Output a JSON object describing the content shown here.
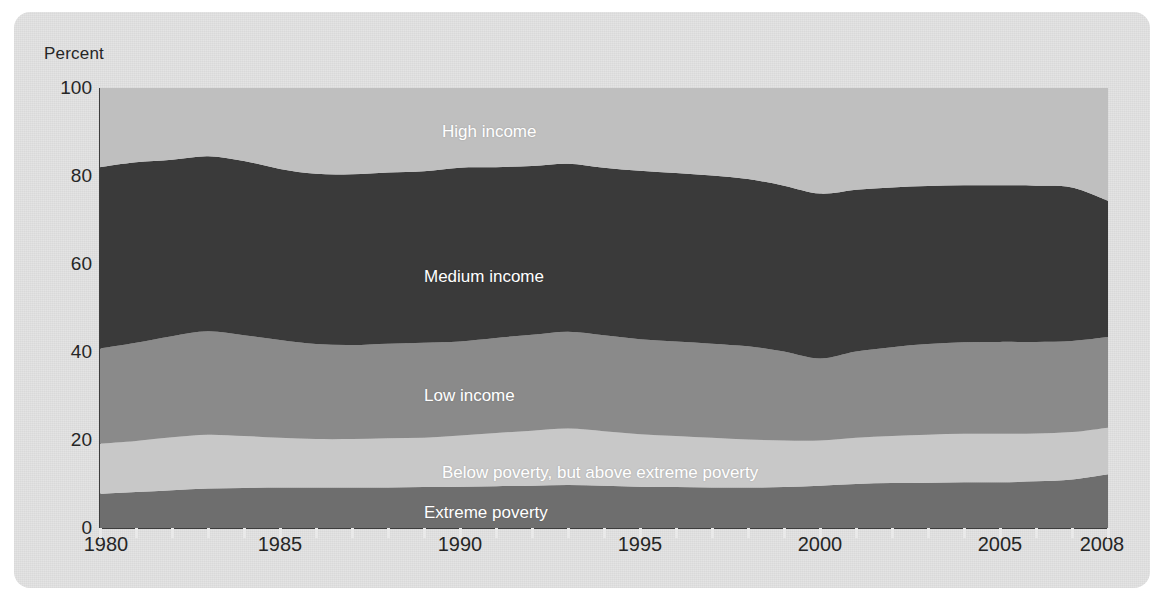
{
  "chart_data": {
    "type": "area",
    "title": "",
    "subtitle": "",
    "xlabel": "",
    "ylabel": "Percent",
    "xlim": [
      1980,
      2008
    ],
    "ylim": [
      0,
      100
    ],
    "grid": false,
    "stacked": true,
    "legend_position": "inline-labels",
    "yticks": [
      0,
      20,
      40,
      60,
      80,
      100
    ],
    "xticks": [
      1980,
      1985,
      1990,
      1995,
      2000,
      2005,
      2008
    ],
    "x_minor_tick_interval": 1,
    "x": [
      1980,
      1981,
      1982,
      1983,
      1984,
      1985,
      1986,
      1987,
      1988,
      1989,
      1990,
      1991,
      1992,
      1993,
      1994,
      1995,
      1996,
      1997,
      1998,
      1999,
      2000,
      2001,
      2002,
      2003,
      2004,
      2005,
      2006,
      2007,
      2008
    ],
    "series": [
      {
        "name": "Extreme poverty",
        "color": "#6e6e6e",
        "label_x": 1989.0,
        "label_y": 3.5,
        "values": [
          7.8,
          8.2,
          8.6,
          9.0,
          9.1,
          9.2,
          9.2,
          9.2,
          9.2,
          9.3,
          9.4,
          9.5,
          9.6,
          9.8,
          9.6,
          9.4,
          9.3,
          9.2,
          9.2,
          9.3,
          9.6,
          10.0,
          10.2,
          10.3,
          10.4,
          10.4,
          10.6,
          11.0,
          12.2
        ]
      },
      {
        "name": "Below poverty, but above extreme poverty",
        "color": "#c8c8c8",
        "label_x": 1989.5,
        "label_y": 12.5,
        "values": [
          11.4,
          11.6,
          12.0,
          12.2,
          11.8,
          11.3,
          11.0,
          11.0,
          11.2,
          11.2,
          11.6,
          12.1,
          12.5,
          12.8,
          12.4,
          11.9,
          11.6,
          11.3,
          10.9,
          10.6,
          10.3,
          10.5,
          10.7,
          10.9,
          11.0,
          11.0,
          10.9,
          10.8,
          10.6
        ]
      },
      {
        "name": "Low income",
        "color": "#8a8a8a",
        "label_x": 1989.0,
        "label_y": 30.0,
        "values": [
          21.6,
          22.3,
          23.0,
          23.5,
          22.9,
          22.2,
          21.6,
          21.4,
          21.5,
          21.6,
          21.4,
          21.6,
          21.8,
          22.0,
          21.8,
          21.6,
          21.5,
          21.4,
          21.2,
          20.2,
          18.6,
          19.6,
          20.2,
          20.6,
          20.8,
          20.9,
          20.8,
          20.7,
          20.6
        ]
      },
      {
        "name": "Medium income",
        "color": "#3a3a3a",
        "label_x": 1989.0,
        "label_y": 57.0,
        "values": [
          41.2,
          41.0,
          40.1,
          39.8,
          39.6,
          38.9,
          38.7,
          38.8,
          38.9,
          39.0,
          39.5,
          38.8,
          38.4,
          38.2,
          38.1,
          38.3,
          38.3,
          38.2,
          38.0,
          37.7,
          37.5,
          36.8,
          36.3,
          35.9,
          35.7,
          35.6,
          35.5,
          34.9,
          31.0
        ]
      },
      {
        "name": "High income",
        "color": "#bfbfbf",
        "label_x": 1989.5,
        "label_y": 90.0,
        "values": [
          18.0,
          16.9,
          16.3,
          15.5,
          16.6,
          18.4,
          19.5,
          19.6,
          19.2,
          18.9,
          18.1,
          18.0,
          17.7,
          17.2,
          18.1,
          18.8,
          19.3,
          19.9,
          20.7,
          22.2,
          24.0,
          23.1,
          22.6,
          22.3,
          22.1,
          22.1,
          22.2,
          22.6,
          25.6
        ]
      }
    ]
  },
  "axes": {
    "y_axis_title": "Percent",
    "y_tick_labels": [
      "0",
      "20",
      "40",
      "60",
      "80",
      "100"
    ],
    "x_tick_labels": [
      "1980",
      "1985",
      "1990",
      "1995",
      "2000",
      "2005",
      "2008"
    ]
  }
}
